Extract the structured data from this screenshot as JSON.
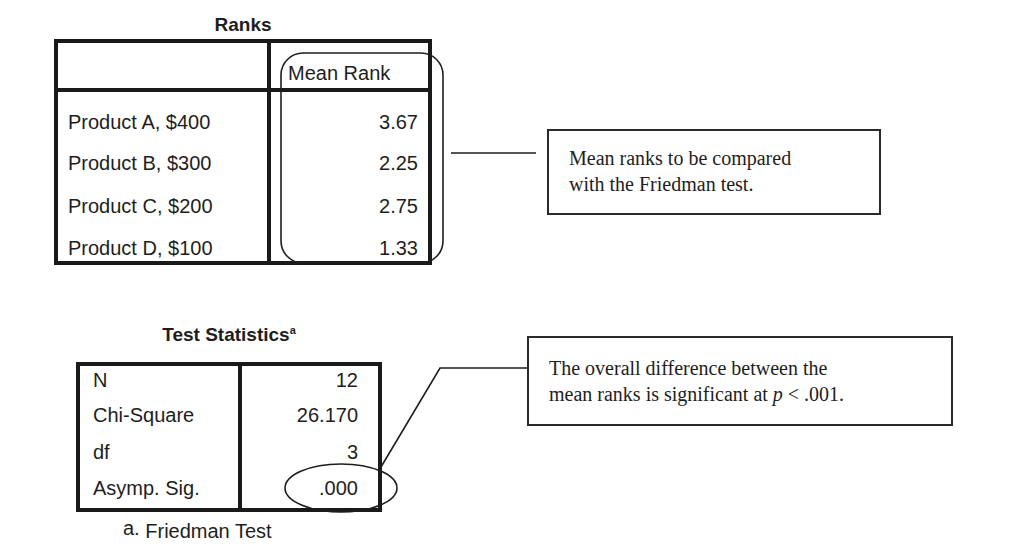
{
  "ranks_table": {
    "title": "Ranks",
    "column_header": "Mean Rank",
    "rows": [
      {
        "label": "Product A, $400",
        "mean_rank": "3.67"
      },
      {
        "label": "Product B, $300",
        "mean_rank": "2.25"
      },
      {
        "label": "Product C, $200",
        "mean_rank": "2.75"
      },
      {
        "label": "Product D, $100",
        "mean_rank": "1.33"
      }
    ]
  },
  "ranks_callout": {
    "line1": "Mean ranks to be compared",
    "line2": "with the Friedman test."
  },
  "test_statistics_table": {
    "title": "Test Statistics",
    "title_superscript": "a",
    "rows": [
      {
        "label": "N",
        "value": "12"
      },
      {
        "label": "Chi-Square",
        "value": "26.170"
      },
      {
        "label": "df",
        "value": "3"
      },
      {
        "label": "Asymp. Sig.",
        "value": ".000"
      }
    ],
    "footnote_marker": "a.",
    "footnote_text": "Friedman Test"
  },
  "significance_callout": {
    "line1": "The overall difference between the",
    "line2_prefix": "mean ranks is significant at ",
    "line2_italic": "p",
    "line2_suffix": " < .001."
  },
  "colors": {
    "border": "#1a1a1a",
    "text": "#1e1e1e",
    "background": "#ffffff"
  }
}
